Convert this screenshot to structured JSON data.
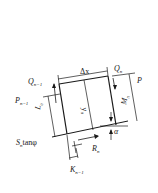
{
  "diagram": {
    "title": "",
    "type": "slice-force-diagram",
    "labels": {
      "delta_x": "Δx",
      "q_n": "Q",
      "q_n_sub": "n",
      "q_n1": "Q",
      "q_n1_sub": "n−1",
      "p": "P",
      "p_n1": "P",
      "p_n1_sub": "n−1",
      "l_n": "L",
      "l_n_sub": "n",
      "y_n": "y",
      "y_n_sub": "n",
      "m_n": "M",
      "m_n_sub": "n",
      "alpha": "α",
      "s_n_tan": "S",
      "s_n_tan_sub": "n",
      "s_n_tan_suffix": "tanφ",
      "r_n": "R",
      "r_n_sub": "n",
      "k_n1": "K",
      "k_n1_sub": "n−1"
    },
    "colors": {
      "ink": "#1a1a1a",
      "background": "#ffffff"
    }
  }
}
